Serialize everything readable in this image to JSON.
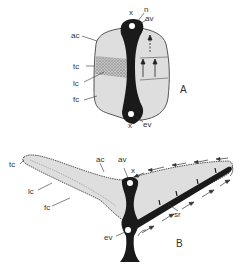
{
  "figure_a": {
    "panel_label": "A",
    "labels": {
      "n": "n",
      "av": "av",
      "x_top": "x",
      "x_bottom": "x",
      "ac": "ac",
      "tc": "tc",
      "lc": "lc",
      "fc": "fc",
      "ev": "ev"
    }
  },
  "figure_b": {
    "panel_label": "B",
    "labels": {
      "tc": "tc",
      "lc": "lc",
      "fc": "fc",
      "ac": "ac",
      "av": "av",
      "x": "x",
      "sr": "sr",
      "ev": "ev"
    }
  },
  "colors": {
    "fill_light": "#dcdcdc",
    "stipple": "#a8a8a8",
    "dark": "#1a1a1a",
    "outline": "#555555"
  }
}
